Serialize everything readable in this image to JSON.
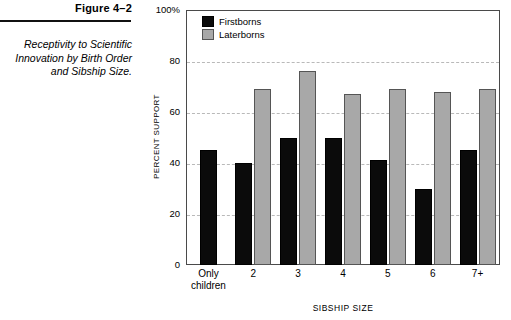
{
  "figure": {
    "number": "Figure 4–2",
    "caption": "Receptivity to Scientific Innovation by Birth Order and Sibship Size."
  },
  "chart_data": {
    "type": "bar",
    "title": "Receptivity to Scientific Innovation by Birth Order and Sibship Size.",
    "xlabel": "SIBSHIP SIZE",
    "ylabel": "PERCENT SUPPORT",
    "ylim": [
      0,
      100
    ],
    "yticks": [
      "0",
      "20",
      "40",
      "60",
      "80",
      "100%"
    ],
    "ytick_values": [
      0,
      20,
      40,
      60,
      80,
      100
    ],
    "grid": true,
    "gridlines": [
      20,
      40,
      60,
      80
    ],
    "legend_position": "top-left",
    "categories": [
      "Only children",
      "2",
      "3",
      "4",
      "5",
      "6",
      "7+"
    ],
    "category_lines": [
      [
        "Only",
        "children"
      ],
      [
        "2"
      ],
      [
        "3"
      ],
      [
        "4"
      ],
      [
        "5"
      ],
      [
        "6"
      ],
      [
        "7+"
      ]
    ],
    "series": [
      {
        "name": "Firstborns",
        "color": "#0b0b0b",
        "values": [
          45,
          40,
          50,
          50,
          41,
          30,
          45
        ]
      },
      {
        "name": "Laterborns",
        "color": "#a8a8a8",
        "values": [
          null,
          69,
          76,
          67,
          69,
          68,
          69
        ]
      }
    ]
  }
}
